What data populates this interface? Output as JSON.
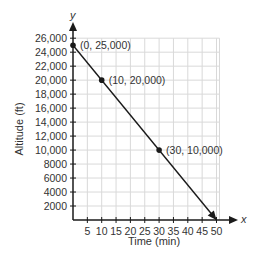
{
  "chart_data": {
    "type": "line",
    "title": "",
    "xlabel": "Time (min)",
    "ylabel": "Altitude (ft)",
    "x_axis_letter": "x",
    "y_axis_letter": "y",
    "xlim": [
      0,
      50
    ],
    "ylim": [
      0,
      26000
    ],
    "grid": true,
    "x_ticks": [
      5,
      10,
      15,
      20,
      25,
      30,
      35,
      40,
      45,
      50
    ],
    "x_tick_labels": [
      "5",
      "10",
      "15",
      "20",
      "25",
      "30",
      "35",
      "40",
      "45",
      "50"
    ],
    "y_ticks": [
      2000,
      4000,
      6000,
      8000,
      10000,
      12000,
      14000,
      16000,
      18000,
      20000,
      22000,
      24000,
      26000
    ],
    "y_tick_labels": [
      "2000",
      "4000",
      "6000",
      "8000",
      "10,000",
      "12,000",
      "14,000",
      "16,000",
      "18,000",
      "20,000",
      "22,000",
      "24,000",
      "26,000"
    ],
    "series": [
      {
        "name": "Altitude",
        "x": [
          0,
          50
        ],
        "y": [
          25000,
          0
        ],
        "end_arrow": true
      }
    ],
    "points": [
      {
        "x": 0,
        "y": 25000,
        "label": "(0, 25,000)"
      },
      {
        "x": 10,
        "y": 20000,
        "label": "(10, 20,000)"
      },
      {
        "x": 30,
        "y": 10000,
        "label": "(30, 10,000)"
      }
    ],
    "colors": {
      "axis": "#1a1a1a",
      "grid": "#d9d9d9",
      "line": "#1a1a1a",
      "text": "#333333"
    }
  }
}
